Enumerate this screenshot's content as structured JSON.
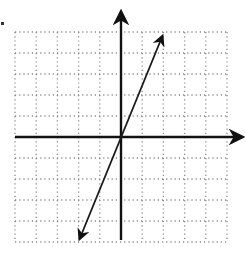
{
  "figure": {
    "grid": {
      "x_min": -5,
      "x_max": 5,
      "y_min": -5,
      "y_max": 5,
      "step": 1,
      "style": "dotted"
    },
    "axes": {
      "x_axis_arrow": "right",
      "y_axis_arrow": "up"
    },
    "line": {
      "through": [
        [
          -2,
          -5
        ],
        [
          0,
          0
        ],
        [
          2,
          5
        ]
      ],
      "slope": 2.5,
      "intercept": 0,
      "arrows": "both-ends"
    },
    "colors": {
      "grid": "#8a8a8a",
      "axes": "#111111",
      "line": "#1a1a1a"
    }
  }
}
